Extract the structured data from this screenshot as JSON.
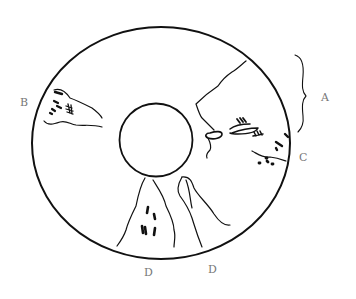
{
  "diagram": {
    "type": "annular line drawing with annotated regions",
    "labels": {
      "A": "A",
      "B": "B",
      "C": "C",
      "D1": "D",
      "D2": "D"
    },
    "colors": {
      "line": "#111111",
      "label": "#777777",
      "background": "#ffffff"
    }
  }
}
